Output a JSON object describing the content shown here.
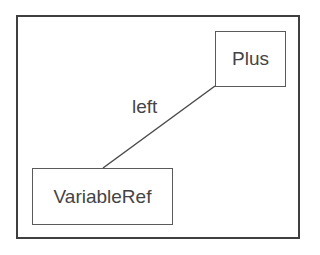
{
  "diagram": {
    "nodes": [
      {
        "id": "plus",
        "label": "Plus"
      },
      {
        "id": "variableref",
        "label": "VariableRef"
      }
    ],
    "edges": [
      {
        "from": "plus",
        "to": "variableref",
        "label": "left"
      }
    ],
    "colors": {
      "stroke": "#3f3f3f",
      "text": "#444444",
      "background": "#ffffff"
    }
  }
}
